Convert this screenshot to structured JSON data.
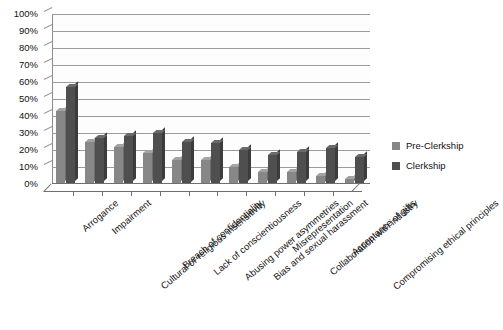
{
  "chart_data": {
    "type": "bar",
    "title": "",
    "xlabel": "",
    "ylabel": "",
    "ylim": [
      0,
      100
    ],
    "grid": true,
    "legend_position": "right",
    "y_ticks": [
      "0%",
      "10%",
      "20%",
      "30%",
      "40%",
      "50%",
      "60%",
      "70%",
      "80%",
      "90%",
      "100%"
    ],
    "y_tick_values": [
      0,
      10,
      20,
      30,
      40,
      50,
      60,
      70,
      80,
      90,
      100
    ],
    "categories": [
      "Arrogance",
      "Impairment",
      "Cultural or religious insensitivity",
      "Breach of confidentiality",
      "Lack of conscientiousness",
      "Abusing power asymmetries",
      "Bias and sexual harassment",
      "Misrepresentation",
      "Collaboration with industry",
      "Acceptance of gifts",
      "Compromising ethical principles"
    ],
    "series": [
      {
        "name": "Pre-Clerkship",
        "color": "#878787",
        "values": [
          43,
          25,
          22,
          18,
          14,
          14,
          10,
          7,
          7,
          5,
          3
        ]
      },
      {
        "name": "Clerkship",
        "color": "#4f4f4f",
        "values": [
          57,
          27,
          28,
          30,
          25,
          24,
          20,
          17,
          19,
          21,
          16
        ]
      }
    ]
  },
  "legend": {
    "entries": [
      {
        "label": "Pre-Clerkship",
        "color": "#878787"
      },
      {
        "label": "Clerkship",
        "color": "#4f4f4f"
      }
    ]
  }
}
